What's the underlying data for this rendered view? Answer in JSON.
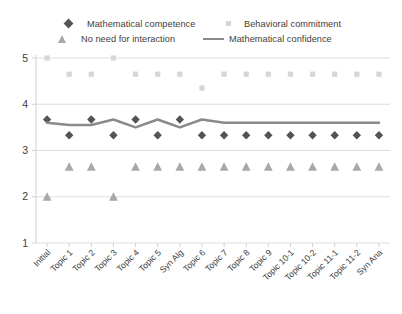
{
  "legend": {
    "items": [
      {
        "label": "Mathematical competence",
        "marker": "diamond-marker-icon",
        "color": "#545454"
      },
      {
        "label": "No need for interaction",
        "marker": "triangle-marker-icon",
        "color": "#a8a8a8"
      },
      {
        "label": "Behavioral commitment",
        "marker": "square-marker-icon",
        "color": "#d6d6d6"
      },
      {
        "label": "Mathematical confidence",
        "marker": "line-marker-icon",
        "color": "#8a8a8a"
      }
    ]
  },
  "axes": {
    "y_ticks": [
      "5",
      "4",
      "3",
      "2",
      "1"
    ],
    "x_labels": [
      "Initial",
      "Topic 1",
      "Topic 2",
      "Topic 3",
      "Topic 4",
      "Topic 5",
      "Syn Alg",
      "Topic 6",
      "Topic 7",
      "Topic 8",
      "Topic 9",
      "Topic 10-1",
      "Topic 10-2",
      "Topic 11-1",
      "Topic 11-2",
      "Syn Ana"
    ]
  },
  "chart_data": {
    "type": "line",
    "title": "",
    "xlabel": "",
    "ylabel": "",
    "ylim": [
      1,
      5
    ],
    "grid": true,
    "legend_position": "top",
    "categories": [
      "Initial",
      "Topic 1",
      "Topic 2",
      "Topic 3",
      "Topic 4",
      "Topic 5",
      "Syn Alg",
      "Topic 6",
      "Topic 7",
      "Topic 8",
      "Topic 9",
      "Topic 10-1",
      "Topic 10-2",
      "Topic 11-1",
      "Topic 11-2",
      "Syn Ana"
    ],
    "series": [
      {
        "name": "Mathematical competence",
        "marker": "diamond",
        "color": "#545454",
        "values": [
          3.67,
          3.33,
          3.67,
          3.33,
          3.67,
          3.33,
          3.67,
          3.33,
          3.33,
          3.33,
          3.33,
          3.33,
          3.33,
          3.33,
          3.33,
          3.33
        ]
      },
      {
        "name": "No need for interaction",
        "marker": "triangle",
        "color": "#a8a8a8",
        "values": [
          2.0,
          2.65,
          2.65,
          2.0,
          2.65,
          2.65,
          2.65,
          2.65,
          2.65,
          2.65,
          2.65,
          2.65,
          2.65,
          2.65,
          2.65,
          2.65
        ]
      },
      {
        "name": "Behavioral commitment",
        "marker": "square",
        "color": "#d6d6d6",
        "values": [
          5.0,
          4.65,
          4.65,
          5.0,
          4.65,
          4.65,
          4.65,
          4.35,
          4.65,
          4.65,
          4.65,
          4.65,
          4.65,
          4.65,
          4.65,
          4.65
        ]
      },
      {
        "name": "Mathematical confidence",
        "marker": "line",
        "color": "#8a8a8a",
        "values": [
          3.6,
          3.55,
          3.55,
          3.67,
          3.5,
          3.67,
          3.5,
          3.67,
          3.6,
          3.6,
          3.6,
          3.6,
          3.6,
          3.6,
          3.6,
          3.6
        ]
      }
    ]
  }
}
